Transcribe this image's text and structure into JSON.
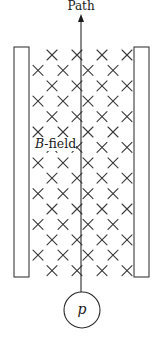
{
  "diagram": {
    "title": "Path",
    "field_label_italic": "B",
    "field_label_rest": "-field",
    "particle_label": "p",
    "colors": {
      "stroke": "#3a3a3a",
      "background": "#ffffff"
    },
    "plates": [
      {
        "name": "left-plate",
        "x": 14,
        "y": 47,
        "width": 15,
        "height": 230
      },
      {
        "name": "right-plate",
        "x": 134,
        "y": 47,
        "width": 15,
        "height": 230
      }
    ],
    "path": {
      "x": 81,
      "y_top": 12,
      "y_bottom": 292
    },
    "particle": {
      "cx": 82,
      "cy": 310,
      "r": 18
    },
    "field": {
      "symbol": "×",
      "direction": "into page",
      "row_start_y": 55,
      "row_step": 15.4,
      "rows": 15,
      "odd_row_x": [
        52,
        77,
        102,
        127
      ],
      "even_row_x": [
        38,
        63,
        88,
        113
      ],
      "cross_half": 5
    },
    "field_label_pos": {
      "x": 35,
      "y": 148
    }
  }
}
